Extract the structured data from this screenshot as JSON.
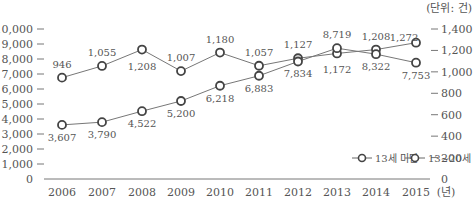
{
  "chart_data": {
    "type": "line",
    "title": "",
    "unit_label": "(단위: 건)",
    "xlabel": "(년)",
    "x": [
      "2006",
      "2007",
      "2008",
      "2009",
      "2010",
      "2011",
      "2012",
      "2013",
      "2014",
      "2015"
    ],
    "left_axis": {
      "ticks": [
        "10,000",
        "9,000",
        "8,000",
        "7,000",
        "6,000",
        "5,000",
        "4,000",
        "3,000",
        "2,000",
        "1,000",
        "0"
      ],
      "ylim": [
        0,
        10000
      ]
    },
    "right_axis": {
      "ticks": [
        "1,400",
        "1,200",
        "1,000",
        "800",
        "600",
        "400",
        "200",
        "0"
      ],
      "ylim": [
        0,
        1400
      ]
    },
    "series": [
      {
        "name": "13세 미만",
        "axis": "right",
        "values": [
          946,
          1055,
          1208,
          1007,
          1180,
          1057,
          1127,
          1172,
          1208,
          1272
        ],
        "labels": [
          "946",
          "1,055",
          "1,208",
          "1,007",
          "1,180",
          "1,057",
          "1,127",
          "1,172",
          "1,208",
          "1,272"
        ]
      },
      {
        "name": "13~20세",
        "axis": "left",
        "values": [
          3607,
          3790,
          4522,
          5200,
          6218,
          6883,
          7834,
          8719,
          8322,
          7753
        ],
        "labels": [
          "3,607",
          "3,790",
          "4,522",
          "5,200",
          "6,218",
          "6,883",
          "7,834",
          "8,719",
          "8,322",
          "7,753"
        ]
      }
    ],
    "legend": [
      "13세 미만",
      "13~20세"
    ],
    "legend_position": "lower-right",
    "grid": false
  }
}
